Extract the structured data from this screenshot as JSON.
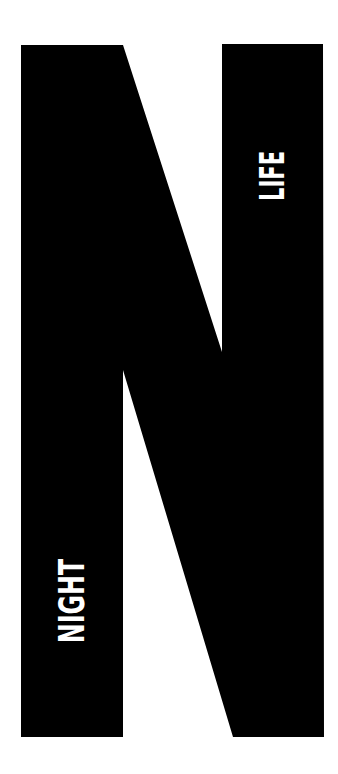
{
  "poster": {
    "letter": "N",
    "words": {
      "top_right": "LIFE",
      "bottom_left": "NIGHT"
    },
    "colors": {
      "background": "#ffffff",
      "letter": "#000000",
      "text": "#ffffff"
    }
  }
}
